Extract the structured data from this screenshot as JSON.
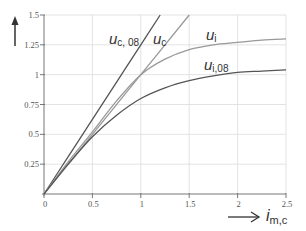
{
  "chart_data": {
    "type": "line",
    "title": "",
    "xlabel": "i",
    "xlabel_sub": "m,c",
    "ylabel": "",
    "xlim": [
      0,
      2.5
    ],
    "ylim": [
      0,
      1.5
    ],
    "grid": true,
    "x_ticks": [
      0,
      0.5,
      1,
      1.5,
      2,
      2.5
    ],
    "x_tick_labels": [
      "0",
      "0.5",
      "1",
      "1.5",
      "2",
      "2.5"
    ],
    "y_ticks": [
      0.25,
      0.5,
      0.75,
      1,
      1.25,
      1.5
    ],
    "y_tick_labels": [
      "0.25",
      "0.5",
      "0.75",
      "1",
      "1.25",
      "1.5"
    ],
    "series": [
      {
        "name": "u_c,08",
        "label_main": "u",
        "label_sub": "c, 08",
        "color": "#555555",
        "x": [
          0,
          0.25,
          0.5,
          0.75,
          1,
          1.2
        ],
        "y": [
          0,
          0.3125,
          0.625,
          0.9375,
          1.25,
          1.5
        ]
      },
      {
        "name": "u_c",
        "label_main": "u",
        "label_sub": "c",
        "color": "#999999",
        "x": [
          0,
          0.5,
          1,
          1.5
        ],
        "y": [
          0,
          0.5,
          1,
          1.5
        ]
      },
      {
        "name": "u_i",
        "label_main": "u",
        "label_sub": "i",
        "color": "#999999",
        "x": [
          0,
          0.25,
          0.5,
          0.75,
          1,
          1.25,
          1.5,
          1.75,
          2,
          2.25,
          2.5
        ],
        "y": [
          0,
          0.27,
          0.52,
          0.78,
          1.0,
          1.13,
          1.21,
          1.25,
          1.27,
          1.29,
          1.3
        ]
      },
      {
        "name": "u_i,08",
        "label_main": "u",
        "label_sub": "i,08",
        "color": "#555555",
        "x": [
          0,
          0.25,
          0.5,
          0.75,
          1,
          1.25,
          1.5,
          1.75,
          2,
          2.25,
          2.5
        ],
        "y": [
          0,
          0.25,
          0.48,
          0.66,
          0.8,
          0.89,
          0.95,
          0.99,
          1.02,
          1.03,
          1.04
        ]
      }
    ]
  }
}
